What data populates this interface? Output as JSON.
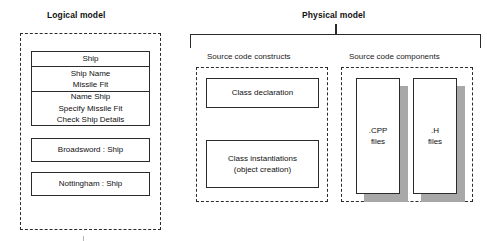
{
  "diagram": {
    "title_logical": "Logical model",
    "title_physical": "Physical model"
  },
  "logical_model": {
    "class_box": {
      "name": "Ship",
      "attributes": [
        "Ship Name",
        "Missile Fit"
      ],
      "operations": [
        "Name Ship",
        "Specify Missile Fit",
        "Check Ship Details"
      ]
    },
    "objects": [
      {
        "label": "Broadsword : Ship"
      },
      {
        "label": "Nottingham : Ship"
      }
    ]
  },
  "physical_model": {
    "source_code_constructs": {
      "caption": "Source code constructs",
      "items": [
        {
          "line1": "Class declaration",
          "line2": ""
        },
        {
          "line1": "Class instantiations",
          "line2": "(object creation)"
        }
      ]
    },
    "source_code_components": {
      "caption": "Source code components",
      "items": [
        {
          "line1": ".CPP",
          "line2": "files"
        },
        {
          "line1": ".H",
          "line2": "files"
        }
      ]
    }
  },
  "colors": {
    "stroke": "#2b2b2b",
    "shadow": "#a8a8a8",
    "background": "#ffffff",
    "text": "#111111"
  }
}
